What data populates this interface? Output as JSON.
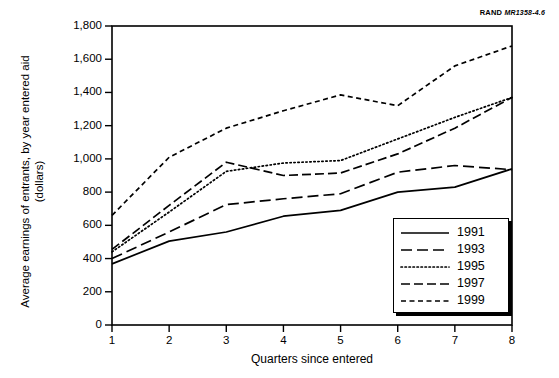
{
  "figure": {
    "source_label_prefix": "RAND",
    "source_label_code": "MR1358-4.6"
  },
  "chart_data": {
    "type": "line",
    "title": "",
    "xlabel": "Quarters since entered",
    "ylabel": "Average earnings of entrants, by year entered aid (dollars)",
    "ylabel_line1": "Average earnings of entrants, by year entered aid",
    "ylabel_line2": "(dollars)",
    "x": [
      1,
      2,
      3,
      4,
      5,
      6,
      7,
      8
    ],
    "xtick_labels": [
      "1",
      "2",
      "3",
      "4",
      "5",
      "6",
      "7",
      "8"
    ],
    "ytick_labels": [
      "0",
      "200",
      "400",
      "600",
      "800",
      "1,000",
      "1,200",
      "1,400",
      "1,600",
      "1,800"
    ],
    "ytick_values": [
      0,
      200,
      400,
      600,
      800,
      1000,
      1200,
      1400,
      1600,
      1800
    ],
    "xlim": [
      1,
      8
    ],
    "ylim": [
      0,
      1800
    ],
    "grid": false,
    "legend_position": "lower right",
    "series": [
      {
        "name": "1991",
        "style": "solid",
        "values": [
          368,
          505,
          560,
          655,
          690,
          800,
          830,
          940
        ]
      },
      {
        "name": "1993",
        "style": "long-dash",
        "values": [
          400,
          560,
          725,
          760,
          790,
          920,
          960,
          935
        ]
      },
      {
        "name": "1995",
        "style": "dotted",
        "values": [
          440,
          680,
          925,
          975,
          990,
          1120,
          1250,
          1370
        ]
      },
      {
        "name": "1997",
        "style": "dash-dot",
        "values": [
          455,
          720,
          980,
          900,
          915,
          1030,
          1185,
          1370
        ]
      },
      {
        "name": "1999",
        "style": "short-dash",
        "values": [
          660,
          1010,
          1185,
          1290,
          1385,
          1320,
          1560,
          1680
        ]
      }
    ]
  }
}
